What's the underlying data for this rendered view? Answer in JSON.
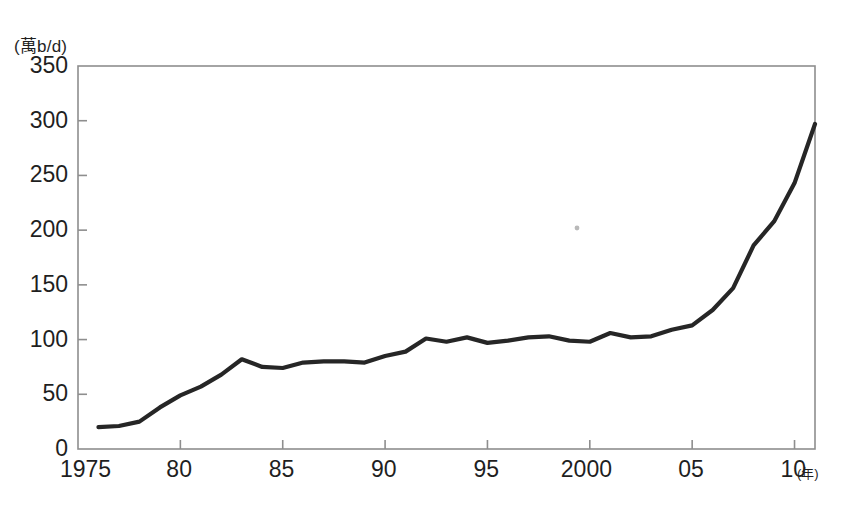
{
  "chart_data": {
    "type": "line",
    "title": "",
    "subtitle": "",
    "xlabel": "(年)",
    "ylabel": "(萬b/d)",
    "xlim": [
      1975,
      2011
    ],
    "ylim": [
      0,
      350
    ],
    "grid": false,
    "legend": null,
    "x_tick_labels": [
      "1975",
      "80",
      "85",
      "90",
      "95",
      "2000",
      "05",
      "10"
    ],
    "x_tick_values": [
      1975,
      1980,
      1985,
      1990,
      1995,
      2000,
      2005,
      2010
    ],
    "y_tick_labels": [
      "0",
      "50",
      "100",
      "150",
      "200",
      "250",
      "300",
      "350"
    ],
    "y_tick_values": [
      0,
      50,
      100,
      150,
      200,
      250,
      300,
      350
    ],
    "series": [
      {
        "name": "",
        "color": "#262626",
        "x": [
          1976,
          1977,
          1978,
          1979,
          1980,
          1981,
          1982,
          1983,
          1984,
          1985,
          1986,
          1987,
          1988,
          1989,
          1990,
          1991,
          1992,
          1993,
          1994,
          1995,
          1996,
          1997,
          1998,
          1999,
          2000,
          2001,
          2002,
          2003,
          2004,
          2005,
          2006,
          2007,
          2008,
          2009,
          2010,
          2011
        ],
        "values": [
          20,
          21,
          25,
          38,
          49,
          57,
          68,
          82,
          75,
          74,
          79,
          80,
          80,
          79,
          85,
          89,
          101,
          98,
          102,
          97,
          99,
          102,
          103,
          99,
          98,
          106,
          102,
          103,
          109,
          113,
          127,
          147,
          186,
          208,
          243,
          297
        ]
      }
    ]
  },
  "annotations": {
    "speck_note": "scan-artifact-dot"
  }
}
